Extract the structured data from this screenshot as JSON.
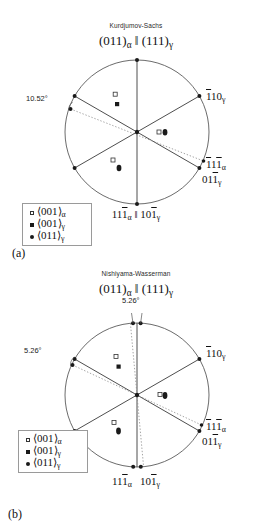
{
  "figure": {
    "type": "stereographic-projection-pair",
    "panels": [
      {
        "letter": "(a)",
        "title": "Kurdjumov-Sachs",
        "relation": "(011)α ‖ (111)γ",
        "relation_parts": {
          "left_plane": "(011)",
          "left_sub": "α",
          "parallel": "‖",
          "right_plane": "(111)",
          "right_sub": "γ"
        },
        "angle_annotations": [
          {
            "name": "left-misorientation",
            "value": "10.52°"
          }
        ],
        "pole_labels": [
          {
            "name": "pole-1bar10-gamma",
            "text": "́1́10γ",
            "main": "110",
            "over": [
              0
            ],
            "sub": "γ"
          },
          {
            "name": "pole-1bar11bar-alpha",
            "text": "́1́11́α",
            "main": "111",
            "over": [
              0,
              2
            ],
            "sub": "α"
          },
          {
            "name": "pole-011bar-gamma",
            "text": "011́γ",
            "main": "011",
            "over": [
              2
            ],
            "sub": "γ"
          }
        ],
        "bottom_label": {
          "name": "bottom-pole-pair",
          "left_main": "111",
          "left_over": [
            2
          ],
          "left_sub": "α",
          "separator": "‖",
          "right_main": "101",
          "right_over": [
            2
          ],
          "right_sub": "γ"
        },
        "legend": [
          {
            "symbol": "open-square",
            "text": "⟨001⟩",
            "sub": "α"
          },
          {
            "symbol": "filled-square",
            "text": "⟨001⟩",
            "sub": "γ"
          },
          {
            "symbol": "filled-circle",
            "text": "⟨011⟩",
            "sub": "γ"
          }
        ]
      },
      {
        "letter": "(b)",
        "title": "Nishiyama-Wasserman",
        "relation": "(011)α ‖ (111)γ",
        "relation_parts": {
          "left_plane": "(011)",
          "left_sub": "α",
          "parallel": "‖",
          "right_plane": "(111)",
          "right_sub": "γ"
        },
        "angle_annotations": [
          {
            "name": "top-misorientation",
            "value": "5.26°"
          },
          {
            "name": "left-misorientation",
            "value": "5.26°"
          }
        ],
        "pole_labels": [
          {
            "name": "pole-1bar10-gamma",
            "text": "́1́10γ",
            "main": "110",
            "over": [
              0
            ],
            "sub": "γ"
          },
          {
            "name": "pole-1bar11bar-alpha",
            "text": "́1́11́α",
            "main": "111",
            "over": [
              0,
              2
            ],
            "sub": "α"
          },
          {
            "name": "pole-011bar-gamma",
            "text": "011́γ",
            "main": "011",
            "over": [
              2
            ],
            "sub": "γ"
          }
        ],
        "bottom_label": {
          "name": "bottom-pole-pair",
          "left_main": "111",
          "left_over": [
            2
          ],
          "left_sub": "α",
          "separator": "",
          "right_main": "101",
          "right_over": [
            2
          ],
          "right_sub": "γ"
        },
        "legend": [
          {
            "symbol": "open-square",
            "text": "⟨001⟩",
            "sub": "α"
          },
          {
            "symbol": "filled-square",
            "text": "⟨001⟩",
            "sub": "γ"
          },
          {
            "symbol": "filled-circle",
            "text": "⟨011⟩",
            "sub": "γ"
          }
        ]
      }
    ],
    "colors": {
      "ink": "#1a1a1a",
      "circle_stroke": "#5a5a5a",
      "solid_line": "#3a3a3a",
      "dotted_line": "#8d8d8d",
      "legend_border": "#9a9a9a",
      "background": "#ffffff"
    }
  }
}
